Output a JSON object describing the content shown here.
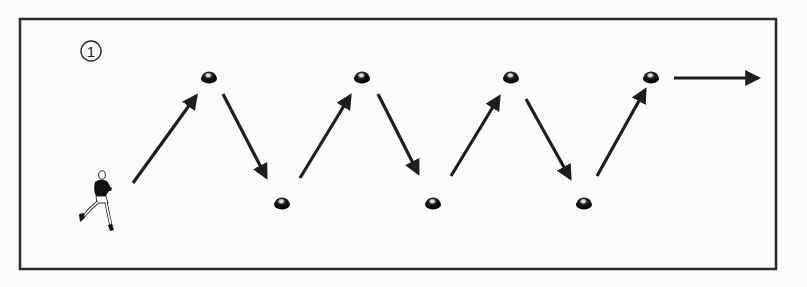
{
  "diagram": {
    "type": "drill-diagram",
    "step_label": "1",
    "colors": {
      "background": "#fafafa",
      "frame": "#2a2a2a",
      "arrow": "#1e1e1e",
      "cone": "#111111"
    },
    "frame": {
      "x": 20,
      "y": 19,
      "width": 756,
      "height": 250
    },
    "runner": {
      "x": 98,
      "y": 200
    },
    "markers": [
      {
        "id": "m1",
        "x": 209,
        "y": 77
      },
      {
        "id": "m2",
        "x": 282,
        "y": 203
      },
      {
        "id": "m3",
        "x": 362,
        "y": 77
      },
      {
        "id": "m4",
        "x": 433,
        "y": 203
      },
      {
        "id": "m5",
        "x": 511,
        "y": 77
      },
      {
        "id": "m6",
        "x": 584,
        "y": 203
      },
      {
        "id": "m7",
        "x": 651,
        "y": 77
      }
    ],
    "arrows": [
      {
        "x1": 133,
        "y1": 183,
        "x2": 196,
        "y2": 96
      },
      {
        "x1": 223,
        "y1": 94,
        "x2": 266,
        "y2": 177
      },
      {
        "x1": 300,
        "y1": 178,
        "x2": 350,
        "y2": 96
      },
      {
        "x1": 378,
        "y1": 94,
        "x2": 418,
        "y2": 173
      },
      {
        "x1": 451,
        "y1": 176,
        "x2": 499,
        "y2": 97
      },
      {
        "x1": 526,
        "y1": 99,
        "x2": 570,
        "y2": 178
      },
      {
        "x1": 597,
        "y1": 176,
        "x2": 645,
        "y2": 90
      },
      {
        "x1": 674,
        "y1": 78,
        "x2": 758,
        "y2": 78
      }
    ]
  }
}
